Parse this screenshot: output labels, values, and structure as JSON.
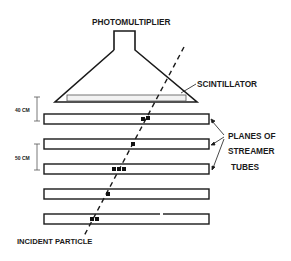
{
  "diagram": {
    "labels": {
      "photomultiplier": "PHOTOMULTIPLIER",
      "scintillator": "SCINTILLATOR",
      "planes_line1": "PLANES OF",
      "planes_line2": "STREAMER",
      "planes_line3": "TUBES",
      "incident_particle": "INCIDENT PARTICLE",
      "spacing_top": "40 CM",
      "spacing_mid": "50 CM"
    },
    "colors": {
      "ink": "#1a1a1a",
      "scintillator_fill": "#f2f2f2",
      "background": "#ffffff"
    },
    "planes": [
      {
        "index": 1,
        "y": 114,
        "hits": [
          141,
          146
        ]
      },
      {
        "index": 2,
        "y": 139,
        "hits": [
          131
        ]
      },
      {
        "index": 3,
        "y": 164,
        "hits": [
          112,
          117,
          122
        ]
      },
      {
        "index": 4,
        "y": 189,
        "hits": [
          106
        ]
      },
      {
        "index": 5,
        "y": 214,
        "hits": [
          91,
          96
        ]
      }
    ]
  }
}
